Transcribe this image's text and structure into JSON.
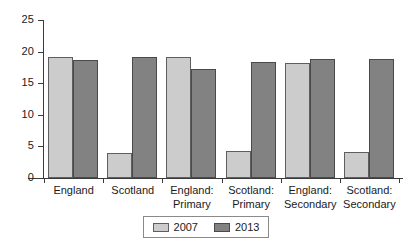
{
  "chart_data": {
    "type": "bar",
    "title": "",
    "subtitle": "",
    "xlabel": "",
    "ylabel": "",
    "ylim": [
      0,
      25
    ],
    "yticks": [
      0,
      5,
      10,
      15,
      20,
      25
    ],
    "grid": false,
    "legend_position": "bottom",
    "categories": [
      "England",
      "Scotland",
      "England: Primary",
      "Scotland: Primary",
      "England: Secondary",
      "Scotland: Secondary"
    ],
    "category_lines": [
      [
        "England",
        ""
      ],
      [
        "Scotland",
        ""
      ],
      [
        "England:",
        "Primary"
      ],
      [
        "Scotland:",
        "Primary"
      ],
      [
        "England:",
        "Secondary"
      ],
      [
        "Scotland:",
        "Secondary"
      ]
    ],
    "series": [
      {
        "name": "2007",
        "color": "#cccccc",
        "values": [
          19.2,
          4.0,
          19.1,
          4.3,
          18.2,
          4.1
        ]
      },
      {
        "name": "2013",
        "color": "#828282",
        "values": [
          18.7,
          19.2,
          17.3,
          18.3,
          18.9,
          18.9
        ]
      }
    ]
  },
  "axis": {
    "y_tick_labels": [
      "0",
      "5",
      "10",
      "15",
      "20",
      "25"
    ]
  },
  "legend": {
    "items": [
      {
        "label": "2007",
        "color": "#cccccc"
      },
      {
        "label": "2013",
        "color": "#828282"
      }
    ]
  }
}
